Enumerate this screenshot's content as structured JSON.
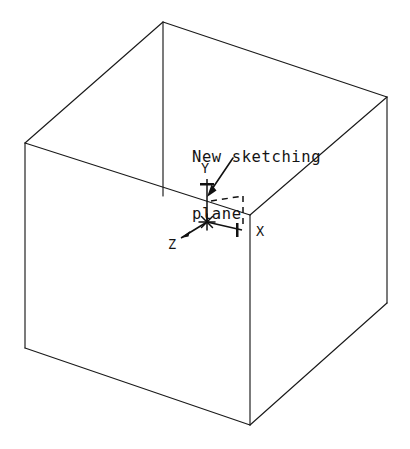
{
  "figure": {
    "width": 410,
    "height": 449,
    "background_color": "#ffffff",
    "line_color": "#1a1a1a",
    "kind": "isometric-wireframe-cube-with-coordinate-triad"
  },
  "callout": {
    "line1": "New sketching",
    "line2": "plane",
    "full_text": "New sketching plane",
    "x": 192,
    "y": 110
  },
  "axes": {
    "origin": {
      "x": 207,
      "y": 222,
      "marker": "asterisk"
    },
    "items": [
      {
        "name": "y-axis",
        "label": "Y",
        "direction": "up",
        "label_x": 201,
        "label_y": 168,
        "tip_x": 207,
        "tip_y": 179
      },
      {
        "name": "x-axis",
        "label": "X",
        "direction": "right",
        "label_x": 256,
        "label_y": 231,
        "tip_x": 245,
        "tip_y": 230
      },
      {
        "name": "z-axis",
        "label": "Z",
        "direction": "down-left",
        "label_x": 168,
        "label_y": 244,
        "tip_x": 183,
        "tip_y": 237
      }
    ]
  },
  "sketching_plane": {
    "name": "dashed-plane-outline",
    "style": "dashed",
    "corner_x": 243,
    "corner_y": 196
  },
  "cube": {
    "vertices": {
      "top_apex": {
        "x": 163,
        "y": 22
      },
      "top_left": {
        "x": 25,
        "y": 143
      },
      "top_right": {
        "x": 387,
        "y": 97
      },
      "back_center": {
        "x": 250,
        "y": 215
      },
      "bottom_left": {
        "x": 25,
        "y": 348
      },
      "bottom_front": {
        "x": 250,
        "y": 425
      },
      "bottom_right": {
        "x": 387,
        "y": 303
      }
    }
  }
}
